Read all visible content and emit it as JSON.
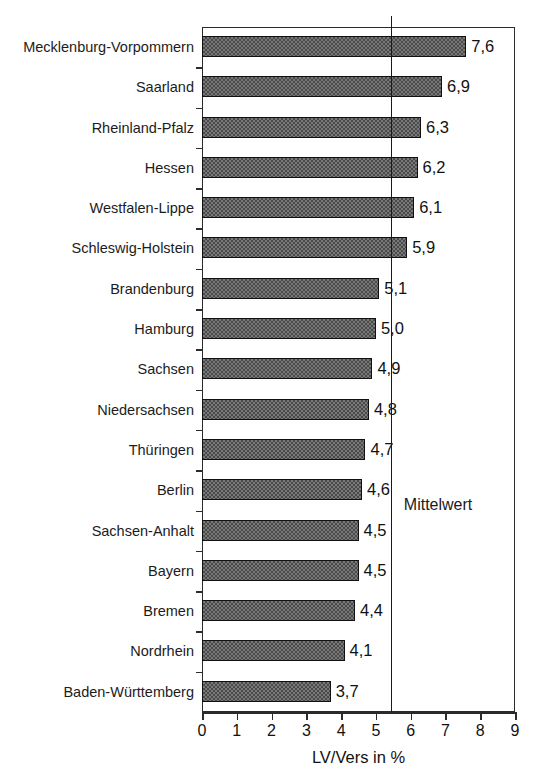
{
  "chart_data": {
    "type": "bar",
    "orientation": "horizontal",
    "title": "",
    "xlabel": "LV/Vers in %",
    "ylabel": "",
    "xlim": [
      0,
      9
    ],
    "xticks": [
      "0",
      "1",
      "2",
      "3",
      "4",
      "5",
      "6",
      "7",
      "8",
      "9"
    ],
    "grid": false,
    "legend": null,
    "categories": [
      "Mecklenburg-Vorpommern",
      "Saarland",
      "Rheinland-Pfalz",
      "Hessen",
      "Westfalen-Lippe",
      "Schleswig-Holstein",
      "Brandenburg",
      "Hamburg",
      "Sachsen",
      "Niedersachsen",
      "Thüringen",
      "Berlin",
      "Sachsen-Anhalt",
      "Bayern",
      "Bremen",
      "Nordrhein",
      "Baden-Württemberg"
    ],
    "values": [
      7.6,
      6.9,
      6.3,
      6.2,
      6.1,
      5.9,
      5.1,
      5.0,
      4.9,
      4.8,
      4.7,
      4.6,
      4.5,
      4.5,
      4.4,
      4.1,
      3.7
    ],
    "value_labels": [
      "7,6",
      "6,9",
      "6,3",
      "6,2",
      "6,1",
      "5,9",
      "5,1",
      "5,0",
      "4,9",
      "4,8",
      "4,7",
      "4,6",
      "4,5",
      "4,5",
      "4,4",
      "4,1",
      "3,7"
    ],
    "annotations": [
      {
        "name": "mittelwert",
        "label": "Mittelwert",
        "value": 5.43
      }
    ],
    "colors": {
      "bar_fill": "#787878",
      "bar_pattern": "#4a4a4a",
      "bar_border": "#111111",
      "axis": "#2b2b2b",
      "text": "#111111",
      "background": "#ffffff"
    }
  }
}
